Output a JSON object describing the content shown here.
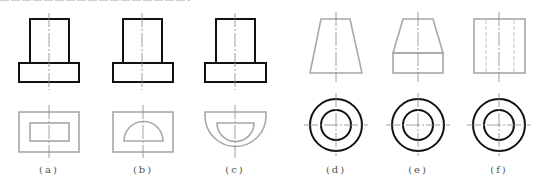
{
  "figure": {
    "top_clipped_text": "",
    "colors": {
      "dark": "#111111",
      "gray": "#a8a8a8",
      "center": "#888888"
    },
    "panels": [
      {
        "id": "a",
        "label": "(a)",
        "front": "stepped-block",
        "top_view": "rectangle-in-rectangle"
      },
      {
        "id": "b",
        "label": "(b)",
        "front": "stepped-block",
        "top_view": "half-disk-in-rectangle"
      },
      {
        "id": "c",
        "label": "(c)",
        "front": "stepped-block",
        "top_view": "half-disk-in-half-disk"
      },
      {
        "id": "d",
        "label": "(d)",
        "front": "trapezoid",
        "top_view": "concentric-circles"
      },
      {
        "id": "e",
        "label": "(e)",
        "front": "trapezoid-on-rectangle",
        "top_view": "concentric-circles"
      },
      {
        "id": "f",
        "label": "(f)",
        "front": "rectangle-with-hidden-lines",
        "top_view": "concentric-circles"
      }
    ]
  }
}
